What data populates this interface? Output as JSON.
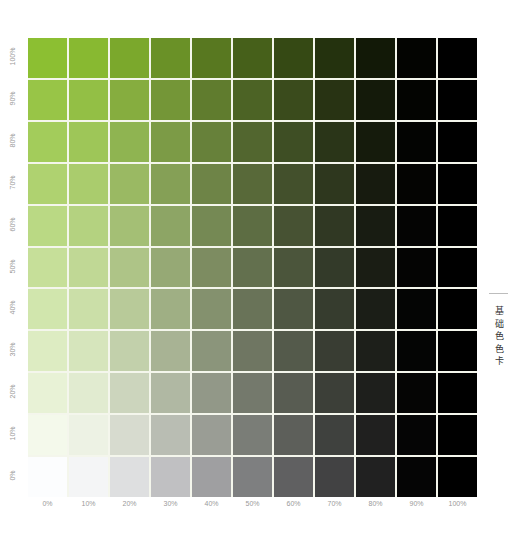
{
  "side_title": "基础色色卡",
  "x_labels": [
    "0%",
    "10%",
    "20%",
    "30%",
    "40%",
    "50%",
    "60%",
    "70%",
    "80%",
    "90%",
    "100%"
  ],
  "y_labels_top_to_bottom": [
    "100%",
    "90%",
    "80%",
    "70%",
    "60%",
    "50%",
    "40%",
    "30%",
    "20%",
    "10%",
    "0%"
  ],
  "chart_data": {
    "type": "heatmap",
    "title": "基础色色卡",
    "xlabel": "black %",
    "ylabel": "green saturation %",
    "x": [
      "0%",
      "10%",
      "20%",
      "30%",
      "40%",
      "50%",
      "60%",
      "70%",
      "80%",
      "90%",
      "100%"
    ],
    "y": [
      "100%",
      "90%",
      "80%",
      "70%",
      "60%",
      "50%",
      "40%",
      "30%",
      "20%",
      "10%",
      "0%"
    ],
    "base_color": "#8cbf32",
    "column_brightness": [
      1.0,
      0.97,
      0.88,
      0.76,
      0.63,
      0.5,
      0.38,
      0.26,
      0.13,
      0.02,
      0.0
    ],
    "row_base_rgb": [
      [
        140,
        191,
        50
      ],
      [
        152,
        197,
        71
      ],
      [
        163,
        204,
        91
      ],
      [
        175,
        210,
        112
      ],
      [
        186,
        217,
        132
      ],
      [
        198,
        223,
        153
      ],
      [
        209,
        230,
        173
      ],
      [
        221,
        236,
        194
      ],
      [
        232,
        242,
        214
      ],
      [
        244,
        249,
        235
      ],
      [
        252,
        253,
        254
      ]
    ],
    "grid": {
      "rows": 11,
      "cols": 11,
      "gap_color": "#f4f6ec"
    }
  }
}
